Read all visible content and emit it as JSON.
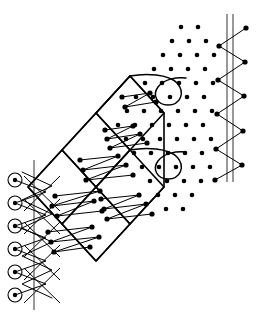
{
  "figure": {
    "canvas": {
      "width": 256,
      "height": 321,
      "background": "#ffffff"
    },
    "ink_color": "#000000",
    "guide_color": "#555555"
  },
  "lattice": {
    "label": "dot lattice",
    "dot_radius": 2.3,
    "spacing_x": 17.5,
    "spacing_y": 17.5,
    "points": [
      [
        181,
        27
      ],
      [
        198,
        27
      ],
      [
        172,
        41
      ],
      [
        189,
        41
      ],
      [
        206,
        41
      ],
      [
        163,
        55
      ],
      [
        180,
        55
      ],
      [
        197,
        55
      ],
      [
        214,
        55
      ],
      [
        154,
        69
      ],
      [
        171,
        69
      ],
      [
        188,
        69
      ],
      [
        205,
        69
      ],
      [
        145,
        83
      ],
      [
        162,
        83
      ],
      [
        179,
        83
      ],
      [
        196,
        83
      ],
      [
        213,
        83
      ],
      [
        136,
        97
      ],
      [
        153,
        97
      ],
      [
        170,
        97
      ],
      [
        187,
        97
      ],
      [
        204,
        97
      ],
      [
        127,
        111
      ],
      [
        144,
        111
      ],
      [
        161,
        111
      ],
      [
        178,
        111
      ],
      [
        195,
        111
      ],
      [
        212,
        111
      ],
      [
        118,
        125
      ],
      [
        135,
        125
      ],
      [
        152,
        125
      ],
      [
        169,
        125
      ],
      [
        186,
        125
      ],
      [
        203,
        125
      ],
      [
        126,
        139
      ],
      [
        143,
        139
      ],
      [
        160,
        139
      ],
      [
        177,
        139
      ],
      [
        194,
        139
      ],
      [
        211,
        139
      ],
      [
        134,
        153
      ],
      [
        151,
        153
      ],
      [
        168,
        153
      ],
      [
        185,
        153
      ],
      [
        202,
        153
      ],
      [
        142,
        167
      ],
      [
        159,
        167
      ],
      [
        176,
        167
      ],
      [
        193,
        167
      ],
      [
        210,
        167
      ],
      [
        150,
        181
      ],
      [
        167,
        181
      ],
      [
        184,
        181
      ],
      [
        201,
        181
      ],
      [
        158,
        195
      ],
      [
        175,
        195
      ],
      [
        192,
        195
      ],
      [
        166,
        209
      ],
      [
        183,
        209
      ]
    ]
  },
  "boundary_rings": {
    "label": "circled lattice sites on left margin",
    "outer_radius": 7.0,
    "core_radius": 2.2,
    "points": [
      [
        15,
        180
      ],
      [
        15,
        203
      ],
      [
        15,
        226
      ],
      [
        15,
        249
      ],
      [
        15,
        272
      ],
      [
        15,
        295
      ]
    ]
  },
  "cells": {
    "label": "diamond scan cells",
    "outlines": [
      "M 28,187 L 62,150 L 96,187 L 62,224 Z",
      "M 62,150 L 96,113 L 130,150 L 96,187 Z",
      "M 96,113 L 130,76 L 164,113 L 130,150 Z",
      "M 62,224 L 96,187 L 130,224 L 96,261 Z",
      "M 96,187 L 130,150 L 164,187 L 130,224 Z"
    ],
    "hull": "M 28,187 L 62,150 L 96,113 L 130,76 L 164,113 L 164,187 L 130,224 L 96,261 L 62,224 Z"
  },
  "scan_paths": {
    "label": "serpentine raster trajectories inside cells",
    "paths": [
      {
        "name": "cell-upper-serpentine",
        "d": "M 105,130 L 133,126 L 107,139 L 140,134 L 110,148 L 147,143",
        "vertices": [
          [
            105,
            130
          ],
          [
            133,
            126
          ],
          [
            107,
            139
          ],
          [
            140,
            134
          ],
          [
            110,
            148
          ],
          [
            147,
            143
          ]
        ]
      },
      {
        "name": "cell-mid-serpentine",
        "d": "M 80,160 L 118,156 L 83,170 L 126,165 L 86,180 L 133,175",
        "vertices": [
          [
            80,
            160
          ],
          [
            118,
            156
          ],
          [
            83,
            170
          ],
          [
            126,
            165
          ],
          [
            86,
            180
          ],
          [
            133,
            175
          ]
        ]
      },
      {
        "name": "cell-midlow-serpentine",
        "d": "M 101,199 L 139,195 L 104,209 L 146,204 L 107,219 L 152,214",
        "vertices": [
          [
            101,
            199
          ],
          [
            139,
            195
          ],
          [
            104,
            209
          ],
          [
            146,
            204
          ],
          [
            107,
            219
          ],
          [
            152,
            214
          ]
        ]
      },
      {
        "name": "cell-lower-serpentine",
        "d": "M 55,196 L 100,191 L 52,206 L 94,201 L 57,216 L 102,211",
        "vertices": [
          [
            55,
            196
          ],
          [
            100,
            191
          ],
          [
            52,
            206
          ],
          [
            94,
            201
          ],
          [
            57,
            216
          ],
          [
            102,
            211
          ]
        ]
      },
      {
        "name": "cell-bottom-serpentine",
        "d": "M 48,232 L 92,227 L 51,242 L 99,237 L 54,252 L 90,247",
        "vertices": [
          [
            48,
            232
          ],
          [
            92,
            227
          ],
          [
            51,
            242
          ],
          [
            99,
            237
          ],
          [
            54,
            252
          ],
          [
            90,
            247
          ]
        ]
      },
      {
        "name": "cell-top-serpentine",
        "d": "M 122,97 L 150,93 L 125,107 L 156,102",
        "vertices": [
          [
            122,
            97
          ],
          [
            150,
            93
          ],
          [
            125,
            107
          ],
          [
            156,
            102
          ]
        ]
      }
    ]
  },
  "loops": {
    "label": "teardrop turnaround loops at lattice boundary",
    "paths": [
      {
        "name": "loop-upper-teardrop",
        "d": "M 96,113 L 130,76 C 146,73 168,74 177,83 C 186,93 180,105 168,105 C 157,105 152,95 158,87 C 164,79 176,77 186,78"
      },
      {
        "name": "loop-lower-teardrop",
        "d": "M 96,187 L 130,150 C 146,147 168,148 177,157 C 186,167 180,179 168,179 C 157,179 152,169 158,161 C 164,153 176,151 186,152"
      }
    ]
  },
  "left_zigzag": {
    "label": "left boundary zigzag connecting ring sites",
    "vertical_guides": [
      {
        "name": "left-axis-line",
        "x": 34,
        "y1": 160,
        "y2": 310
      }
    ],
    "paths": [
      {
        "name": "left-zigzag-a",
        "d": "M 15,180 L 46,192 L 15,203 L 46,215 L 15,226 L 46,238 L 15,249 L 46,261 L 15,272 L 46,284 L 15,295"
      },
      {
        "name": "left-zigzag-b",
        "d": "M 22,172 L 52,186 L 22,200 L 52,214 L 22,228 L 52,242 L 22,256 L 52,270 L 22,284 L 52,298"
      }
    ],
    "cross_strokes": [
      {
        "d": "M 24,176 L 60,211"
      },
      {
        "d": "M 24,199 L 60,234"
      },
      {
        "d": "M 24,222 L 60,257"
      },
      {
        "d": "M 24,245 L 60,280"
      },
      {
        "d": "M 24,268 L 60,303"
      },
      {
        "d": "M 60,176 L 24,211"
      },
      {
        "d": "M 60,199 L 24,234"
      },
      {
        "d": "M 60,222 L 24,257"
      },
      {
        "d": "M 60,245 L 24,280"
      },
      {
        "d": "M 60,268 L 24,303"
      }
    ]
  },
  "right_zigzag": {
    "label": "right boundary zigzag crossing double vertical line",
    "vertical_guides": [
      {
        "name": "right-axis-line-inner",
        "x": 227,
        "y1": 14,
        "y2": 182
      },
      {
        "name": "right-axis-line-outer",
        "x": 233,
        "y1": 14,
        "y2": 182
      }
    ],
    "path": {
      "name": "right-zigzag",
      "d": "M 246,28 L 219,46 L 245,62 L 218,80 L 244,96 L 217,114 L 243,131 L 216,149 L 242,165 L 215,180"
    },
    "vertices": [
      [
        246,
        28
      ],
      [
        219,
        46
      ],
      [
        245,
        62
      ],
      [
        218,
        80
      ],
      [
        244,
        96
      ],
      [
        217,
        114
      ],
      [
        243,
        131
      ],
      [
        216,
        149
      ],
      [
        242,
        165
      ],
      [
        215,
        180
      ]
    ]
  },
  "scan_vertex_dots": {
    "label": "trajectory turning-point markers",
    "radius": 2.6
  }
}
